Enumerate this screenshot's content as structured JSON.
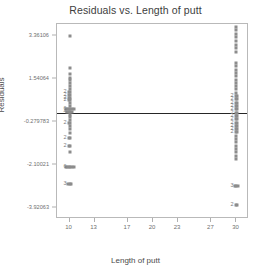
{
  "chart_data": {
    "type": "scatter",
    "title": "Residuals vs. Length of putt",
    "xlabel": "Length of putt",
    "ylabel": "Residuals",
    "xlim": [
      8.5,
      31.5
    ],
    "ylim": [
      -4.4,
      3.85
    ],
    "grid": false,
    "legend": false,
    "marker_color": "#8c8c8c",
    "reference_line": {
      "orientation": "horizontal",
      "value": 0.07,
      "color": "#262626"
    },
    "xticks": [
      {
        "value": 10,
        "label": "10"
      },
      {
        "value": 13,
        "label": "13"
      },
      {
        "value": 17,
        "label": "17"
      },
      {
        "value": 20,
        "label": "20"
      },
      {
        "value": 23,
        "label": "23"
      },
      {
        "value": 27,
        "label": "27"
      },
      {
        "value": 30,
        "label": "30"
      }
    ],
    "yticks": [
      {
        "value": 3.36106,
        "label": "3.36106"
      },
      {
        "value": 1.54064,
        "label": "1.54064"
      },
      {
        "value": -0.279783,
        "label": "-0.279783"
      },
      {
        "value": -2.10021,
        "label": "-2.10021"
      },
      {
        "value": -3.92063,
        "label": "-3.92063"
      }
    ],
    "series": [
      {
        "name": "residuals",
        "points": [
          {
            "x": 10,
            "y": 3.33,
            "count": 1
          },
          {
            "x": 10,
            "y": 2.0,
            "count": 1
          },
          {
            "x": 10,
            "y": 1.72,
            "count": 1
          },
          {
            "x": 10,
            "y": 1.58,
            "count": 1
          },
          {
            "x": 10,
            "y": 1.46,
            "count": 1
          },
          {
            "x": 10,
            "y": 1.34,
            "count": 1
          },
          {
            "x": 10,
            "y": 1.22,
            "count": 1
          },
          {
            "x": 10,
            "y": 1.1,
            "count": 1
          },
          {
            "x": 10,
            "y": 0.98,
            "count": 2
          },
          {
            "x": 10,
            "y": 0.86,
            "count": 2
          },
          {
            "x": 10,
            "y": 0.74,
            "count": 2
          },
          {
            "x": 10,
            "y": 0.62,
            "count": 2
          },
          {
            "x": 10,
            "y": 0.5,
            "count": 1
          },
          {
            "x": 10,
            "y": 0.38,
            "count": 1
          },
          {
            "x": 10,
            "y": 0.26,
            "count": 6
          },
          {
            "x": 10,
            "y": 0.14,
            "count": 4
          },
          {
            "x": 10,
            "y": 0.02,
            "count": 1
          },
          {
            "x": 10,
            "y": -0.1,
            "count": 1
          },
          {
            "x": 10,
            "y": -0.22,
            "count": 1
          },
          {
            "x": 10,
            "y": -0.34,
            "count": 2
          },
          {
            "x": 10,
            "y": -0.46,
            "count": 1
          },
          {
            "x": 10,
            "y": -0.58,
            "count": 1
          },
          {
            "x": 10,
            "y": -0.76,
            "count": 1
          },
          {
            "x": 10,
            "y": -0.98,
            "count": 2
          },
          {
            "x": 10,
            "y": -1.3,
            "count": 2
          },
          {
            "x": 10,
            "y": -1.58,
            "count": 1
          },
          {
            "x": 10,
            "y": -2.22,
            "count": 6
          },
          {
            "x": 10,
            "y": -2.92,
            "count": 3
          },
          {
            "x": 30,
            "y": 3.72,
            "count": 1
          },
          {
            "x": 30,
            "y": 3.58,
            "count": 1
          },
          {
            "x": 30,
            "y": 3.44,
            "count": 1
          },
          {
            "x": 30,
            "y": 3.3,
            "count": 1
          },
          {
            "x": 30,
            "y": 3.14,
            "count": 1
          },
          {
            "x": 30,
            "y": 2.98,
            "count": 1
          },
          {
            "x": 30,
            "y": 2.84,
            "count": 1
          },
          {
            "x": 30,
            "y": 2.68,
            "count": 1
          },
          {
            "x": 30,
            "y": 2.2,
            "count": 1
          },
          {
            "x": 30,
            "y": 2.06,
            "count": 1
          },
          {
            "x": 30,
            "y": 1.92,
            "count": 1
          },
          {
            "x": 30,
            "y": 1.78,
            "count": 1
          },
          {
            "x": 30,
            "y": 1.64,
            "count": 1
          },
          {
            "x": 30,
            "y": 1.5,
            "count": 1
          },
          {
            "x": 30,
            "y": 1.36,
            "count": 1
          },
          {
            "x": 30,
            "y": 1.22,
            "count": 1
          },
          {
            "x": 30,
            "y": 1.08,
            "count": 1
          },
          {
            "x": 30,
            "y": 0.94,
            "count": 1
          },
          {
            "x": 30,
            "y": 0.8,
            "count": 2
          },
          {
            "x": 30,
            "y": 0.66,
            "count": 2
          },
          {
            "x": 30,
            "y": 0.52,
            "count": 2
          },
          {
            "x": 30,
            "y": 0.38,
            "count": 2
          },
          {
            "x": 30,
            "y": 0.24,
            "count": 2
          },
          {
            "x": 30,
            "y": 0.1,
            "count": 2
          },
          {
            "x": 30,
            "y": -0.04,
            "count": 2
          },
          {
            "x": 30,
            "y": -0.18,
            "count": 2
          },
          {
            "x": 30,
            "y": -0.32,
            "count": 2
          },
          {
            "x": 30,
            "y": -0.46,
            "count": 2
          },
          {
            "x": 30,
            "y": -0.6,
            "count": 2
          },
          {
            "x": 30,
            "y": -0.74,
            "count": 2
          },
          {
            "x": 30,
            "y": -0.88,
            "count": 1
          },
          {
            "x": 30,
            "y": -1.02,
            "count": 1
          },
          {
            "x": 30,
            "y": -1.16,
            "count": 1
          },
          {
            "x": 30,
            "y": -1.3,
            "count": 1
          },
          {
            "x": 30,
            "y": -1.44,
            "count": 1
          },
          {
            "x": 30,
            "y": -1.58,
            "count": 1
          },
          {
            "x": 30,
            "y": -1.72,
            "count": 1
          },
          {
            "x": 30,
            "y": -1.86,
            "count": 1
          },
          {
            "x": 30,
            "y": -3.0,
            "count": 3
          },
          {
            "x": 30,
            "y": -3.82,
            "count": 2
          }
        ]
      }
    ]
  }
}
